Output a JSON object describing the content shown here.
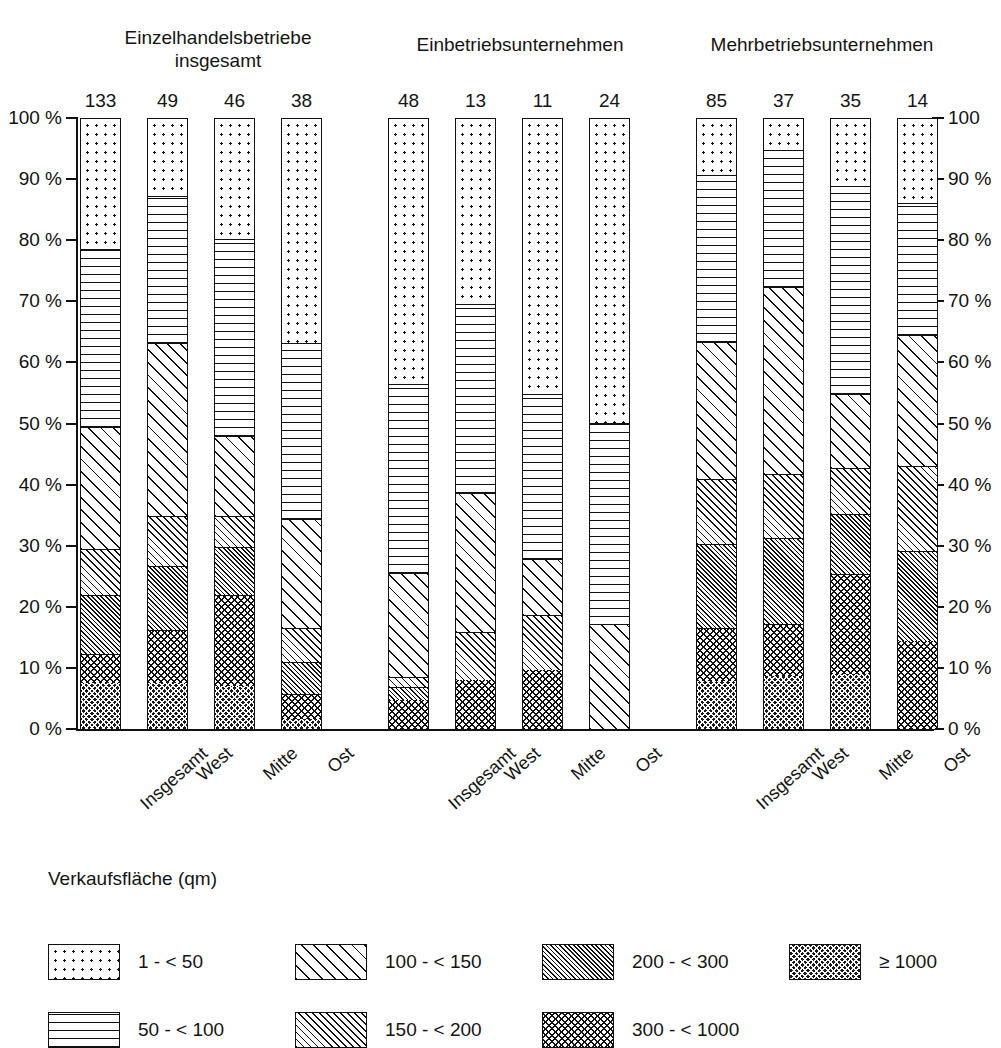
{
  "chart_data": {
    "type": "bar",
    "subtype": "stacked-percentage",
    "title": "",
    "legend_title": "Verkaufsfläche (qm)",
    "legend_position": "bottom",
    "grid": false,
    "ylim": [
      0,
      100
    ],
    "ylabel_left": "%",
    "ylabel_right": "%",
    "y_ticks": [
      "0 %",
      "10 %",
      "20 %",
      "30 %",
      "40 %",
      "50 %",
      "60 %",
      "70 %",
      "80 %",
      "90 %",
      "100 %"
    ],
    "y_ticks_right": [
      "0 %",
      "10 %",
      "20 %",
      "30 %",
      "40 %",
      "50 %",
      "60 %",
      "70 %",
      "80 %",
      "90 %",
      "100"
    ],
    "y_tick_values": [
      0,
      10,
      20,
      30,
      40,
      50,
      60,
      70,
      80,
      90,
      100
    ],
    "group_labels": [
      "Einzelhandelsbetriebe\ninsgesamt",
      "Einbetriebsunternehmen",
      "Mehrbetriebsunternehmen"
    ],
    "categories": [
      "Insgesamt",
      "West",
      "Mitte",
      "Ost"
    ],
    "series": [
      {
        "name": "1 - < 50",
        "key": "s1",
        "pattern": "p-dots"
      },
      {
        "name": "50 - < 100",
        "key": "s2",
        "pattern": "p-hlines"
      },
      {
        "name": "100 - < 150",
        "key": "s3",
        "pattern": "p-diag-wide"
      },
      {
        "name": "150 - < 200",
        "key": "s4",
        "pattern": "p-diag-med"
      },
      {
        "name": "200 - < 300",
        "key": "s5",
        "pattern": "p-diag-fine"
      },
      {
        "name": "300 - < 1000",
        "key": "s6",
        "pattern": "p-cross"
      },
      {
        "name": "≥ 1000",
        "key": "s7",
        "pattern": "p-cross-dense"
      }
    ],
    "groups": [
      {
        "label": "Einzelhandelsbetriebe\ninsgesamt",
        "bars": [
          {
            "category": "Insgesamt",
            "count": "133",
            "values": {
              "s1": 21.5,
              "s2": 29.0,
              "s3": 20.0,
              "s4": 7.5,
              "s5": 9.7,
              "s6": 4.8,
              "s7": 7.5
            }
          },
          {
            "category": "West",
            "count": "49",
            "values": {
              "s1": 12.8,
              "s2": 24.0,
              "s3": 28.3,
              "s4": 8.2,
              "s5": 10.5,
              "s6": 8.7,
              "s7": 7.5
            }
          },
          {
            "category": "Mitte",
            "count": "46",
            "values": {
              "s1": 19.8,
              "s2": 32.2,
              "s3": 13.2,
              "s4": 5.0,
              "s5": 7.9,
              "s6": 14.9,
              "s7": 7.0
            }
          },
          {
            "category": "Ost",
            "count": "38",
            "values": {
              "s1": 36.8,
              "s2": 28.8,
              "s3": 17.8,
              "s4": 5.7,
              "s5": 5.2,
              "s6": 4.1,
              "s7": 1.6
            }
          }
        ]
      },
      {
        "label": "Einbetriebsunternehmen",
        "bars": [
          {
            "category": "Insgesamt",
            "count": "48",
            "values": {
              "s1": 43.5,
              "s2": 31.0,
              "s3": 17.0,
              "s4": 1.6,
              "s5": 2.2,
              "s6": 4.7,
              "s7": 0
            }
          },
          {
            "category": "West",
            "count": "13",
            "values": {
              "s1": 30.5,
              "s2": 30.8,
              "s3": 22.9,
              "s4": 7.8,
              "s5": 0,
              "s6": 8.0,
              "s7": 0
            }
          },
          {
            "category": "Mitte",
            "count": "11",
            "values": {
              "s1": 45.1,
              "s2": 27.1,
              "s3": 9.2,
              "s4": 8.9,
              "s5": 0,
              "s6": 9.7,
              "s7": 0
            }
          },
          {
            "category": "Ost",
            "count": "24",
            "values": {
              "s1": 49.9,
              "s2": 33.1,
              "s3": 17.0,
              "s4": 0,
              "s5": 0,
              "s6": 0,
              "s7": 0
            }
          }
        ]
      },
      {
        "label": "Mehrbetriebsunternehmen",
        "bars": [
          {
            "category": "Insgesamt",
            "count": "85",
            "values": {
              "s1": 9.4,
              "s2": 27.2,
              "s3": 22.5,
              "s4": 10.7,
              "s5": 13.6,
              "s6": 8.8,
              "s7": 7.8
            }
          },
          {
            "category": "West",
            "count": "37",
            "values": {
              "s1": 5.2,
              "s2": 22.4,
              "s3": 30.7,
              "s4": 10.5,
              "s5": 14.0,
              "s6": 8.6,
              "s7": 8.6
            }
          },
          {
            "category": "Mitte",
            "count": "35",
            "values": {
              "s1": 11.2,
              "s2": 34.0,
              "s3": 12.0,
              "s4": 7.6,
              "s5": 9.8,
              "s6": 16.4,
              "s7": 9.0
            }
          },
          {
            "category": "Ost",
            "count": "14",
            "values": {
              "s1": 13.9,
              "s2": 21.6,
              "s3": 21.4,
              "s4": 14.0,
              "s5": 14.7,
              "s6": 14.4,
              "s7": 0
            }
          }
        ]
      }
    ]
  },
  "legend": {
    "title": "Verkaufsfläche (qm)",
    "items": [
      {
        "label": "1 - < 50",
        "pattern": "p-dots",
        "col": 0,
        "row": 0
      },
      {
        "label": "50 - < 100",
        "pattern": "p-hlines",
        "col": 0,
        "row": 1
      },
      {
        "label": "100 - < 150",
        "pattern": "p-diag-wide",
        "col": 1,
        "row": 0
      },
      {
        "label": "150 - < 200",
        "pattern": "p-diag-med",
        "col": 1,
        "row": 1
      },
      {
        "label": "200 - < 300",
        "pattern": "p-diag-fine",
        "col": 2,
        "row": 0
      },
      {
        "label": "300 - < 1000",
        "pattern": "p-cross",
        "col": 2,
        "row": 1
      },
      {
        "label": "≥ 1000",
        "pattern": "p-cross-dense",
        "col": 3,
        "row": 0
      }
    ]
  }
}
